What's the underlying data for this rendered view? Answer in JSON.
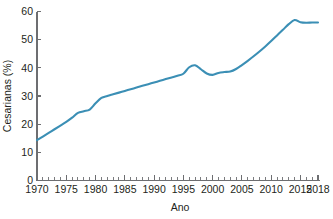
{
  "chart_data": {
    "type": "line",
    "title": "",
    "xlabel": "Ano",
    "ylabel": "Cesarianas (%)",
    "xlim": [
      1970,
      2018
    ],
    "ylim": [
      0,
      60
    ],
    "grid": false,
    "legend": false,
    "legend_position": "none",
    "line_color": "#3b8fb5",
    "axis_color": "#6d6e71",
    "text_color": "#231f20",
    "x_tick_labels": [
      "1970",
      "1975",
      "1980",
      "1985",
      "1990",
      "1995",
      "2000",
      "2005",
      "2010",
      "2015",
      "2018"
    ],
    "x_tick_values": [
      1970,
      1975,
      1980,
      1985,
      1990,
      1995,
      2000,
      2005,
      2010,
      2015,
      2018
    ],
    "x_minor_tick_step": 1,
    "y_tick_labels": [
      "0",
      "10",
      "20",
      "30",
      "40",
      "50",
      "60"
    ],
    "y_tick_values": [
      0,
      10,
      20,
      30,
      40,
      50,
      60
    ],
    "series": [
      {
        "name": "Cesarianas (%)",
        "color": "#3b8fb5",
        "x": [
          1970,
          1971,
          1972,
          1973,
          1974,
          1975,
          1976,
          1977,
          1978,
          1979,
          1980,
          1981,
          1982,
          1983,
          1984,
          1985,
          1986,
          1987,
          1988,
          1989,
          1990,
          1991,
          1992,
          1993,
          1994,
          1995,
          1996,
          1997,
          1998,
          1999,
          2000,
          2001,
          2002,
          2003,
          2004,
          2005,
          2006,
          2007,
          2008,
          2009,
          2010,
          2011,
          2012,
          2013,
          2014,
          2015,
          2016,
          2017,
          2018
        ],
        "values": [
          14.3,
          15.6,
          16.9,
          18.2,
          19.5,
          20.8,
          22.3,
          24.0,
          24.6,
          25.2,
          27.4,
          29.3,
          30.0,
          30.6,
          31.2,
          31.8,
          32.4,
          33.0,
          33.6,
          34.2,
          34.8,
          35.4,
          36.0,
          36.6,
          37.2,
          37.9,
          40.2,
          40.9,
          39.5,
          38.0,
          37.5,
          38.2,
          38.5,
          38.7,
          39.6,
          41.0,
          42.5,
          44.1,
          45.8,
          47.6,
          49.5,
          51.5,
          53.5,
          55.5,
          57.0,
          56.2,
          56.0,
          56.1,
          56.1
        ]
      }
    ]
  }
}
